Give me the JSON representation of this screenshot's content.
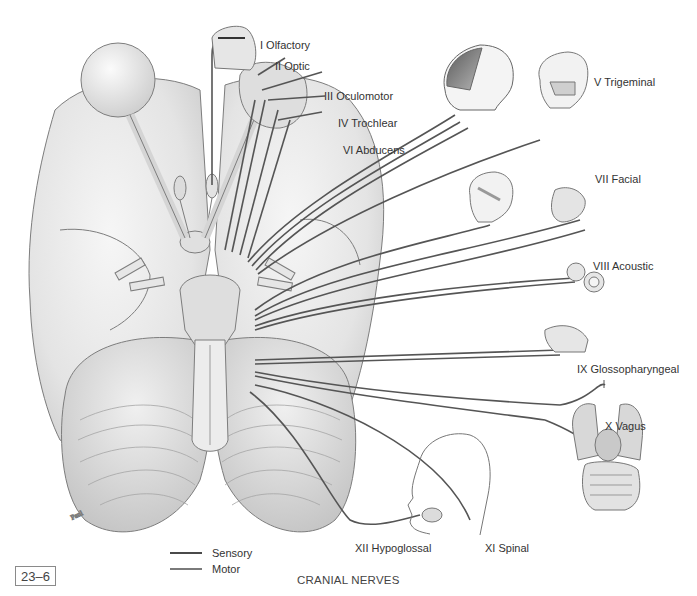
{
  "figure": {
    "number": "23–6",
    "caption": "CRANIAL NERVES"
  },
  "colors": {
    "background": "#ffffff",
    "nerve": "#555555",
    "sensory": "#4a4a4a",
    "motor": "#7a7a7a",
    "tissue_fill": "#e9e9e9",
    "tissue_stroke": "#7d7d7d",
    "text": "#333333"
  },
  "nerves": [
    {
      "id": "I",
      "label": "I Olfactory"
    },
    {
      "id": "II",
      "label": "II Optic"
    },
    {
      "id": "III",
      "label": "III Oculomotor"
    },
    {
      "id": "IV",
      "label": "IV Trochlear"
    },
    {
      "id": "VI",
      "label": "VI Abducens"
    },
    {
      "id": "V",
      "label": "V Trigeminal"
    },
    {
      "id": "VII",
      "label": "VII Facial"
    },
    {
      "id": "VIII",
      "label": "VIII Acoustic"
    },
    {
      "id": "IX",
      "label": "IX Glossopharyngeal"
    },
    {
      "id": "X",
      "label": "X Vagus"
    },
    {
      "id": "XI",
      "label": "XI Spinal"
    },
    {
      "id": "XII",
      "label": "XII Hypoglossal"
    }
  ],
  "legend": {
    "items": [
      {
        "label": "Sensory",
        "type": "sensory"
      },
      {
        "label": "Motor",
        "type": "motor"
      }
    ]
  },
  "illustrations": [
    {
      "name": "brain-inferior-view"
    },
    {
      "name": "nasal-cavity"
    },
    {
      "name": "eyeball"
    },
    {
      "name": "head-dermatome"
    },
    {
      "name": "skull"
    },
    {
      "name": "face-muscles"
    },
    {
      "name": "mouth-tongue"
    },
    {
      "name": "inner-ear"
    },
    {
      "name": "pharynx"
    },
    {
      "name": "thoracic-abdominal-organs"
    },
    {
      "name": "neck-head-profile"
    }
  ]
}
